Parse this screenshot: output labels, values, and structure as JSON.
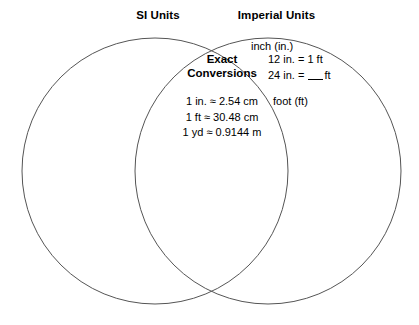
{
  "diagram": {
    "type": "venn-two-set",
    "left_set": {
      "label": "SI Units",
      "items": []
    },
    "right_set": {
      "label": "Imperial Units",
      "items": [
        {
          "text": "inch (in.)",
          "kind": "term"
        },
        {
          "text": "12 in. = 1 ft",
          "kind": "equation"
        },
        {
          "text": "24 in. = ",
          "kind": "equation-blank",
          "suffix": "ft"
        },
        {
          "text": "foot (ft)",
          "kind": "term"
        }
      ]
    },
    "intersection": {
      "title_line_1": "Exact",
      "title_line_2": "Conversions",
      "rows": [
        "1 in. ≈ 2.54 cm",
        "1 ft ≈ 30.48 cm",
        "1 yd ≈ 0.9144 m"
      ]
    },
    "style": {
      "stroke_color": "#555555",
      "background_color": "#ffffff",
      "text_color": "#000000"
    }
  }
}
